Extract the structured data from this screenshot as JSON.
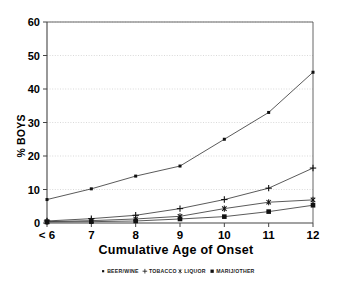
{
  "chart_data": {
    "type": "line",
    "title": "",
    "xlabel": "Cumulative Age of Onset",
    "ylabel": "% BOYS",
    "categories": [
      "< 6",
      "7",
      "8",
      "9",
      "10",
      "11",
      "12"
    ],
    "xticklabels": [
      "< 6",
      "7",
      "8",
      "9",
      "10",
      "11",
      "12"
    ],
    "yticklabels": [
      "0",
      "10",
      "20",
      "30",
      "40",
      "50",
      "60"
    ],
    "yticks": [
      0,
      10,
      20,
      30,
      40,
      50,
      60
    ],
    "ylim": [
      0,
      60
    ],
    "grid": "horizontal-dotted",
    "legend_position": "below-bottom-center",
    "series": [
      {
        "name": "BEER/WINE",
        "marker": "small-square",
        "values": [
          7.0,
          10.2,
          14.0,
          17.0,
          25.0,
          33.0,
          45.0
        ]
      },
      {
        "name": "TOBACCO",
        "marker": "plus",
        "values": [
          0.6,
          1.3,
          2.3,
          4.3,
          7.0,
          10.4,
          16.4
        ]
      },
      {
        "name": "LIQUOR",
        "marker": "asterisk",
        "values": [
          0.4,
          0.7,
          1.2,
          2.0,
          4.3,
          6.2,
          6.9
        ]
      },
      {
        "name": "MARIJ/OTHER",
        "marker": "filled-square",
        "values": [
          0.3,
          0.4,
          0.6,
          1.2,
          1.9,
          3.4,
          5.3
        ]
      }
    ]
  },
  "legend": {
    "items": [
      {
        "label": "BEER/WINE",
        "marker": "small-square"
      },
      {
        "label": "TOBACCO",
        "marker": "plus"
      },
      {
        "label": "LIQUOR",
        "marker": "asterisk"
      },
      {
        "label": "MARIJ/OTHER",
        "marker": "filled-square"
      }
    ]
  },
  "colors": {
    "background": "#ffffff",
    "line": "#3c3c3c",
    "marker": "#111111",
    "grid": "#c9c9c9",
    "axis": "#444444",
    "text": "#000000"
  }
}
